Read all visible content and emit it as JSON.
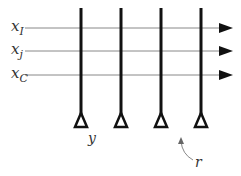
{
  "diagram": {
    "type": "crossbar-array",
    "input_labels": [
      {
        "main": "x",
        "sub": "I"
      },
      {
        "main": "x",
        "sub": "j"
      },
      {
        "main": "x",
        "sub": "C"
      }
    ],
    "column_count": 4,
    "output_label": "y",
    "annotation_label": "r",
    "colors": {
      "horizontal_line": "#888888",
      "vertical_line": "#111111",
      "arrow": "#111111",
      "label": "#333333"
    }
  }
}
